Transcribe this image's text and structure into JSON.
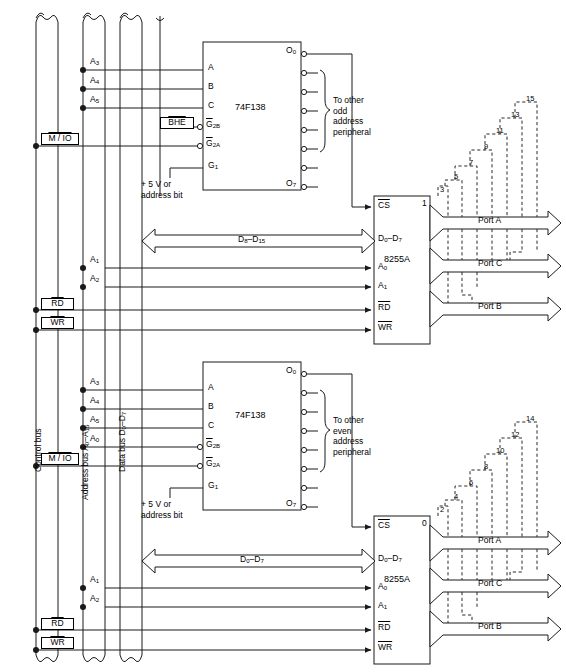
{
  "figure": {
    "caption": ""
  },
  "buses": {
    "control": {
      "label": "Control bus",
      "signals": [
        "M / IO",
        "RD",
        "WR"
      ]
    },
    "address": {
      "label": "Address bus A0-A15"
    },
    "data": {
      "label": "Data bus D0-D7"
    },
    "break_symbol": "bus-break"
  },
  "control_taps": {
    "upper": {
      "mio": "M / IO",
      "rd": "RD",
      "wr": "WR"
    },
    "lower": {
      "mio": "M / IO",
      "rd": "RD",
      "wr": "WR"
    }
  },
  "decoders": [
    {
      "id": "odd",
      "part": "74F138",
      "inputs": [
        "A",
        "B",
        "C",
        "G2B",
        "G2A",
        "G1"
      ],
      "address_taps": [
        "A3",
        "A4",
        "A5"
      ],
      "enable_note": "BHE",
      "supply_note": "+ 5 V or\naddress bit",
      "outputs": {
        "first": "O0",
        "last": "O7",
        "count": 8
      },
      "fanout_note": "To other\nodd\naddress\nperipheral"
    },
    {
      "id": "even",
      "part": "74F138",
      "inputs": [
        "A",
        "B",
        "C",
        "G2B",
        "G2A",
        "G1"
      ],
      "address_taps": [
        "A3",
        "A4",
        "A5",
        "A0"
      ],
      "enable_note": "",
      "supply_note": "+ 5 V or\naddress bit",
      "outputs": {
        "first": "O0",
        "last": "O7",
        "count": 8
      },
      "fanout_note": "To other\neven\naddress\nperipheral"
    }
  ],
  "peripherals": [
    {
      "id": "odd-8255a",
      "part": "8255A",
      "corner_number": "1",
      "pins": [
        "CS",
        "D0-D7",
        "A0",
        "A1",
        "RD",
        "WR"
      ],
      "pin_overlines": [
        "CS",
        "RD",
        "WR"
      ],
      "data_bus_label": "D8-D15",
      "data_bus_pin": "D0-D7",
      "address_taps": [
        "A1",
        "A2"
      ],
      "ports": [
        "Port A",
        "Port C",
        "Port B"
      ],
      "decode_numbers": [
        "3",
        "5",
        "7",
        "9",
        "11",
        "13",
        "15"
      ]
    },
    {
      "id": "even-8255a",
      "part": "8255A",
      "corner_number": "0",
      "pins": [
        "CS",
        "D0-D7",
        "A0",
        "A1",
        "RD",
        "WR"
      ],
      "pin_overlines": [
        "CS",
        "RD",
        "WR"
      ],
      "data_bus_label": "D0-D7",
      "data_bus_pin": "D0-D7",
      "address_taps": [
        "A1",
        "A2"
      ],
      "ports": [
        "Port A",
        "Port C",
        "Port B"
      ],
      "decode_numbers": [
        "2",
        "4",
        "6",
        "8",
        "10",
        "12",
        "14"
      ]
    }
  ],
  "address_bus_taps": {
    "upper_decoder": [
      "A3",
      "A4",
      "A5"
    ],
    "upper_peripheral": [
      "A1",
      "A2"
    ],
    "lower_decoder": [
      "A3",
      "A4",
      "A5",
      "A0"
    ],
    "lower_peripheral": [
      "A1",
      "A2"
    ]
  },
  "colors": {
    "line": "#1a1a1a",
    "text": "#000000",
    "background": "#ffffff",
    "dashed": "#2a2a2a"
  }
}
